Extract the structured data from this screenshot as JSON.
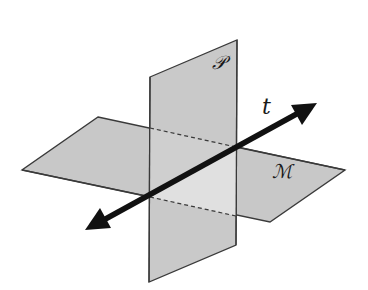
{
  "diagram": {
    "labels": {
      "plane_vertical": "𝒫",
      "plane_horizontal": "ℳ",
      "line": "t"
    },
    "colors": {
      "plane_fill": "#c8c8c8",
      "plane_light_fill": "#dcdcdc",
      "plane_edge": "#3a3a3a",
      "arrow": "#111111",
      "background": "#ffffff"
    },
    "geometry": {
      "plane_P": [
        [
          150,
          77
        ],
        [
          237,
          40
        ],
        [
          236,
          245
        ],
        [
          149,
          282
        ]
      ],
      "plane_M": [
        [
          98,
          117
        ],
        [
          345,
          170
        ],
        [
          270,
          222
        ],
        [
          22,
          170
        ]
      ],
      "dashed_top": [
        [
          150,
          128
        ],
        [
          236,
          147
        ]
      ],
      "dashed_bottom": [
        [
          150,
          197
        ],
        [
          236,
          216
        ]
      ],
      "arrow": [
        [
          85,
          230
        ],
        [
          317,
          103
        ]
      ]
    }
  }
}
